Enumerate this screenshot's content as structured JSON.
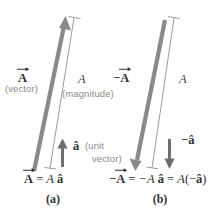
{
  "figure": {
    "colors": {
      "thick_arrow": "#8a8a8a",
      "thin_line": "#8f8f8f",
      "unit_arrow": "#6e6e6e",
      "text_dark": "#2f2f2f",
      "text_grey": "#8a8a8a",
      "background": "#ffffff"
    }
  },
  "panel_a": {
    "caption": "(a)",
    "vector_label": "A",
    "vector_label_note": "(vector)",
    "magnitude_label": "A",
    "magnitude_label_note": "(magnitude)",
    "unit_label": "â",
    "unit_note_line1": "(unit",
    "unit_note_line2": "vector)",
    "equation": {
      "lhs": "A",
      "equals": "=",
      "scalar": "A",
      "unit": "â"
    },
    "icons": {
      "main_arrow": "thick-up-arrow-icon",
      "dimension_line": "dimension-line-icon",
      "unit_arrow": "short-up-arrow-icon"
    }
  },
  "panel_b": {
    "caption": "(b)",
    "vector_label_minus": "−",
    "vector_label": "A",
    "magnitude_label": "A",
    "unit_label_minus": "−",
    "unit_label": "â",
    "equation": {
      "lhs_minus": "−",
      "lhs": "A",
      "equals1": "=",
      "scalar": "−A",
      "unit": "â",
      "equals2": "=",
      "scalar2": "A",
      "paren_open": "(−",
      "unit2": "â",
      "paren_close": ")"
    },
    "icons": {
      "main_arrow": "thick-down-arrow-icon",
      "dimension_line": "dimension-line-icon",
      "unit_arrow": "short-down-arrow-icon"
    }
  }
}
